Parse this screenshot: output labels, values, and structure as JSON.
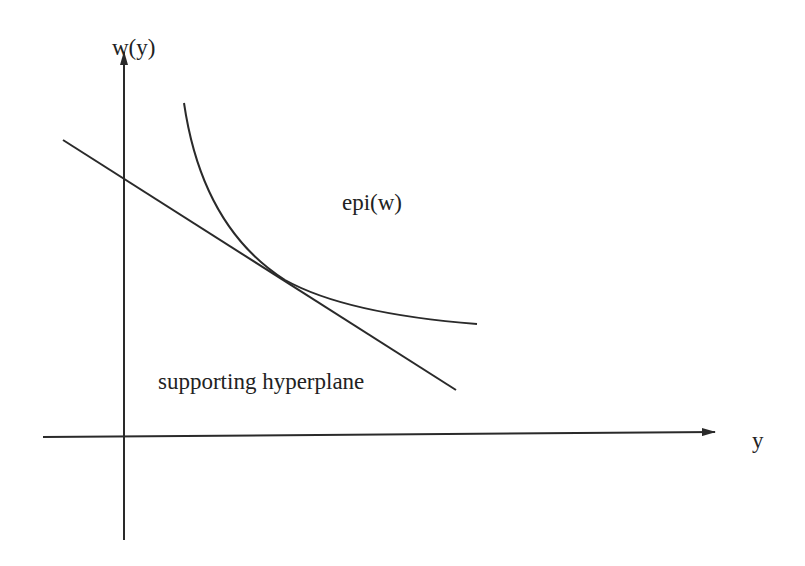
{
  "diagram": {
    "title": "",
    "labels": {
      "vertical_axis": "w(y)",
      "horizontal_axis": "y",
      "region": "epi(w)",
      "line": "supporting hyperplane"
    },
    "colors": {
      "stroke": "#2a2a2a",
      "text": "#222222",
      "background": "#ffffff"
    },
    "elements": [
      {
        "id": "y-axis",
        "type": "arrow",
        "from": [
          124,
          540
        ],
        "to": [
          124,
          50
        ]
      },
      {
        "id": "x-axis",
        "type": "arrow",
        "from": [
          43,
          437
        ],
        "to": [
          715,
          432
        ]
      },
      {
        "id": "supporting-hyperplane",
        "type": "line",
        "from": [
          63,
          140
        ],
        "to": [
          456,
          390
        ]
      },
      {
        "id": "convex-function-curve",
        "type": "curve",
        "from": [
          184,
          103
        ],
        "tangent_point": [
          285,
          280
        ],
        "to": [
          477,
          324
        ]
      }
    ]
  }
}
